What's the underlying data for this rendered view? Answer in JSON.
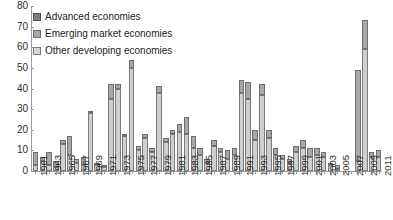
{
  "chart_data": {
    "type": "bar",
    "stacked": true,
    "title": "",
    "xlabel": "",
    "ylabel": "",
    "ylim": [
      0,
      80
    ],
    "yticks": [
      0,
      10,
      20,
      30,
      40,
      50,
      60,
      70,
      80
    ],
    "grid": false,
    "legend_position": "top-left",
    "legend": [
      "Advanced economies",
      "Emerging market economies",
      "Other developing economies"
    ],
    "colors": {
      "advanced": "#7d7d7d",
      "emerging": "#a8a8a8",
      "other_developing": "#cfcfcf"
    },
    "categories": [
      "1961",
      "1962",
      "1963",
      "1964",
      "1965",
      "1966",
      "1967",
      "1968",
      "1969",
      "1970",
      "1971",
      "1972",
      "1973",
      "1974",
      "1975",
      "1976",
      "1977",
      "1978",
      "1979",
      "1980",
      "1981",
      "1982",
      "1983",
      "1984",
      "1985",
      "1986",
      "1987",
      "1988",
      "1989",
      "1990",
      "1991",
      "1992",
      "1993",
      "1994",
      "1995",
      "1996",
      "1997",
      "1998",
      "1999",
      "2000",
      "2001",
      "2002",
      "2003",
      "2004",
      "2005",
      "2006",
      "2007",
      "2008",
      "2009",
      "2010",
      "2011"
    ],
    "tick_labels": [
      "1961",
      "1963",
      "1965",
      "1967",
      "1969",
      "1971",
      "1973",
      "1975",
      "1977",
      "1979",
      "1981",
      "1983",
      "1985",
      "1987",
      "1989",
      "1991",
      "1993",
      "1995",
      "1997",
      "1999",
      "2001",
      "2003",
      "2005",
      "2007",
      "2009",
      "2011"
    ],
    "series": [
      {
        "name": "Advanced economies",
        "key": "adv",
        "color": "#7d7d7d",
        "values": [
          0,
          0,
          0,
          0,
          0,
          0,
          0,
          0,
          0,
          0,
          0,
          0,
          0,
          0,
          0,
          0,
          0,
          0,
          0,
          0,
          0,
          0,
          0,
          0,
          0,
          0,
          0,
          0,
          0,
          0,
          0,
          0,
          0,
          0,
          0,
          0,
          0,
          0,
          0,
          0,
          0,
          0,
          0,
          0,
          0,
          0,
          0,
          0,
          0,
          0,
          0
        ]
      },
      {
        "name": "Emerging market economies",
        "key": "eme",
        "color": "#a8a8a8",
        "values": [
          6,
          2,
          6,
          3,
          2,
          9,
          2,
          4,
          1,
          1,
          1,
          7,
          2,
          1,
          4,
          2,
          2,
          2,
          3,
          2,
          2,
          4,
          8,
          6,
          3,
          2,
          3,
          2,
          4,
          3,
          6,
          8,
          5,
          5,
          4,
          3,
          2,
          2,
          3,
          4,
          4,
          3,
          2,
          1,
          2,
          0,
          0,
          44,
          14,
          2,
          3
        ]
      },
      {
        "name": "Other developing economies",
        "key": "oth",
        "color": "#cfcfcf",
        "values": [
          3,
          5,
          3,
          2,
          13,
          8,
          4,
          3,
          28,
          3,
          2,
          35,
          40,
          17,
          50,
          10,
          16,
          9,
          38,
          14,
          18,
          19,
          18,
          11,
          8,
          4,
          12,
          9,
          6,
          8,
          38,
          35,
          15,
          37,
          16,
          8,
          6,
          4,
          9,
          11,
          7,
          8,
          7,
          3,
          1,
          0,
          0,
          5,
          59,
          7,
          7
        ]
      }
    ]
  }
}
